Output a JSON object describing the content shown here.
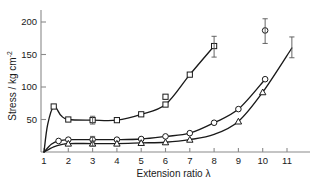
{
  "chart_data": {
    "type": "line",
    "title": "",
    "xlabel": "Extension ratio λ",
    "ylabel_main": "Stress / kg cm",
    "ylabel_exponent": "-2",
    "xlim": [
      0.6,
      11.7
    ],
    "ylim": [
      0,
      215
    ],
    "xticks": [
      1,
      2,
      3,
      4,
      5,
      6,
      7,
      8,
      9,
      10,
      11
    ],
    "xticklabels": [
      "1",
      "2",
      "3",
      "4",
      "5",
      "6",
      "7",
      "8",
      "9",
      "10",
      "11"
    ],
    "yticks": [
      50,
      100,
      150,
      200
    ],
    "yticklabels": [
      "50",
      "100",
      "150",
      "200"
    ],
    "grid": false,
    "legend": "none",
    "series": [
      {
        "name": "series-squares",
        "marker": "square",
        "x": [
          1.0,
          1.15,
          1.4,
          1.7,
          2.0,
          3.0,
          4.0,
          5.0,
          6.0,
          7.0,
          8.0
        ],
        "y": [
          0,
          42,
          70,
          56,
          50,
          49,
          49,
          58,
          73,
          119,
          163
        ],
        "markers_x": [
          1.4,
          2.0,
          3.0,
          4.0,
          5.0,
          6.0,
          7.0,
          8.0
        ],
        "markers_y": [
          70,
          50,
          49,
          49,
          58,
          73,
          119,
          163
        ],
        "stray_points": [
          {
            "x": 6.0,
            "y": 85
          }
        ],
        "errorbars": [
          {
            "x": 3.0,
            "y": 49,
            "minus": 6,
            "plus": 6
          },
          {
            "x": 8.0,
            "y": 163,
            "minus": 17,
            "plus": 15
          }
        ]
      },
      {
        "name": "series-circles",
        "marker": "circle",
        "x": [
          1.0,
          1.3,
          1.6,
          2.0,
          3.0,
          4.0,
          5.0,
          6.0,
          7.0,
          8.0,
          9.0,
          10.1
        ],
        "y": [
          0,
          12,
          17,
          19,
          19,
          19,
          20,
          24,
          29,
          45,
          66,
          112
        ],
        "markers_x": [
          1.6,
          2.0,
          3.0,
          4.0,
          5.0,
          6.0,
          7.0,
          8.0,
          9.0,
          10.1
        ],
        "markers_y": [
          17,
          19,
          19,
          19,
          20,
          24,
          29,
          45,
          66,
          112
        ],
        "stray_points": [],
        "errorbars": [
          {
            "x": 3.0,
            "y": 19,
            "minus": 5,
            "plus": 5
          },
          {
            "x": 10.1,
            "y": 187,
            "minus": 20,
            "plus": 18
          }
        ],
        "terminal_point": {
          "x": 10.1,
          "y": 187
        }
      },
      {
        "name": "series-triangles",
        "marker": "triangle",
        "x": [
          1.0,
          1.4,
          1.8,
          2.0,
          3.0,
          4.0,
          5.0,
          6.0,
          7.0,
          8.0,
          9.0,
          10.0,
          11.2
        ],
        "y": [
          0,
          8,
          12,
          13,
          13,
          13,
          14,
          15,
          19,
          27,
          47,
          92,
          160
        ],
        "markers_x": [
          2.0,
          3.0,
          4.0,
          5.0,
          6.0,
          7.0,
          9.0,
          10.0
        ],
        "markers_y": [
          13,
          13,
          13,
          14,
          15,
          19,
          47,
          92
        ],
        "stray_points": [],
        "errorbars": [
          {
            "x": 3.0,
            "y": 13,
            "minus": 4,
            "plus": 4
          },
          {
            "x": 11.2,
            "y": 160,
            "minus": 15,
            "plus": 17
          }
        ]
      }
    ]
  },
  "figure": {
    "caption": ""
  }
}
